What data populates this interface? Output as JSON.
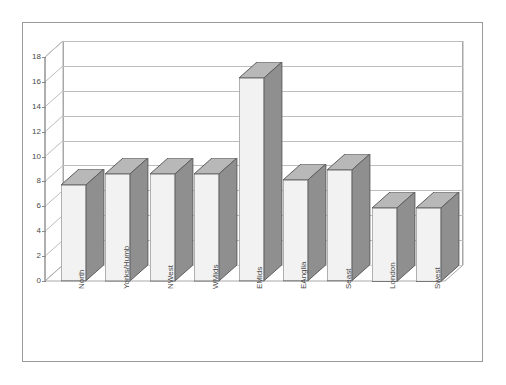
{
  "chart_data": {
    "type": "bar",
    "title": "",
    "subtitle": "",
    "xlabel": "",
    "ylabel": "",
    "categories": [
      "North",
      "Yorks/Humb",
      "NWest",
      "WMids",
      "EMids",
      "EAnglia",
      "Seast",
      "London",
      "Swest"
    ],
    "values": [
      7.7,
      8.6,
      8.6,
      8.6,
      16.3,
      8.1,
      8.9,
      5.9,
      5.9
    ],
    "ylim": [
      0,
      18
    ],
    "ytick_labels": [
      "0",
      "2",
      "4",
      "6",
      "8",
      "10",
      "12",
      "14",
      "16",
      "18"
    ],
    "ytick_values": [
      0,
      2,
      4,
      6,
      8,
      10,
      12,
      14,
      16,
      18
    ],
    "grid": true,
    "legend": false,
    "legend_position": "none",
    "style": "3d-column",
    "colors": {
      "bar_front": "#f2f2f2",
      "bar_side": "#8f8f8f",
      "bar_top": "#b8b8b8",
      "bar_outline": "#6e6e6e",
      "gridline": "#bdbdbd",
      "axis": "#8a8a8a",
      "frame": "#9a9a9a",
      "text": "#4a4a4a",
      "background": "#ffffff"
    }
  },
  "axes": {
    "y_ticks": [
      {
        "label": "0",
        "value": 0
      },
      {
        "label": "2",
        "value": 2
      },
      {
        "label": "4",
        "value": 4
      },
      {
        "label": "6",
        "value": 6
      },
      {
        "label": "8",
        "value": 8
      },
      {
        "label": "10",
        "value": 10
      },
      {
        "label": "12",
        "value": 12
      },
      {
        "label": "14",
        "value": 14
      },
      {
        "label": "16",
        "value": 16
      },
      {
        "label": "18",
        "value": 18
      }
    ],
    "x_ticks": [
      {
        "label": "North"
      },
      {
        "label": "Yorks/Humb"
      },
      {
        "label": "NWest"
      },
      {
        "label": "WMids"
      },
      {
        "label": "EMids"
      },
      {
        "label": "EAnglia"
      },
      {
        "label": "Seast"
      },
      {
        "label": "London"
      },
      {
        "label": "Swest"
      }
    ]
  }
}
